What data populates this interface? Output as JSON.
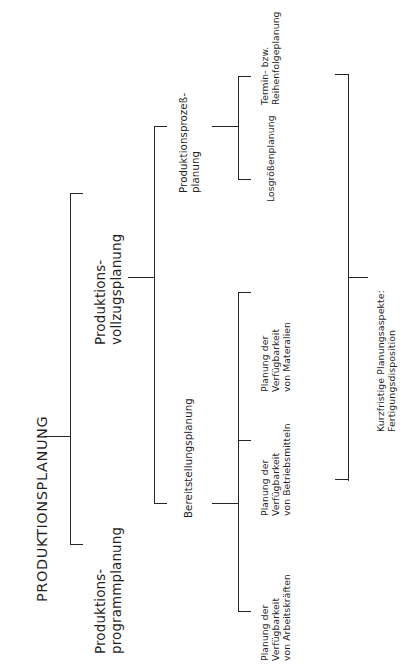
{
  "diagram": {
    "type": "tree",
    "orientation": "rotated-90-ccw",
    "root": {
      "label": "PRODUKTIONSPLANUNG"
    },
    "level2": [
      {
        "label": "Produktions-\nprogrammplanung"
      },
      {
        "label": "Produktions-\nvollzugsplanung"
      }
    ],
    "level3": [
      {
        "label": "Bereitstellungsplanung"
      },
      {
        "label": "Produktionsprozeß-\nplanung"
      }
    ],
    "leaves": [
      {
        "label": "Planung der\nVerfügbarkeit\nvon Arbeitskräften"
      },
      {
        "label": "Planung der\nVerfügbarkeit\nvon Betriebsmitteln"
      },
      {
        "label": "Planung der\nVerfügbarkeit\nvon Materalien"
      },
      {
        "label": "Losgrößenplanung"
      },
      {
        "label": "Termin- bzw.\nReihenfolgeplanung"
      }
    ],
    "bracket": {
      "label": "Kurzfristige Planungsaspekte:\nFertigungsdisposition"
    },
    "colors": {
      "line": "#262626",
      "text": "#1f1f1f",
      "background": "#ffffff"
    }
  }
}
